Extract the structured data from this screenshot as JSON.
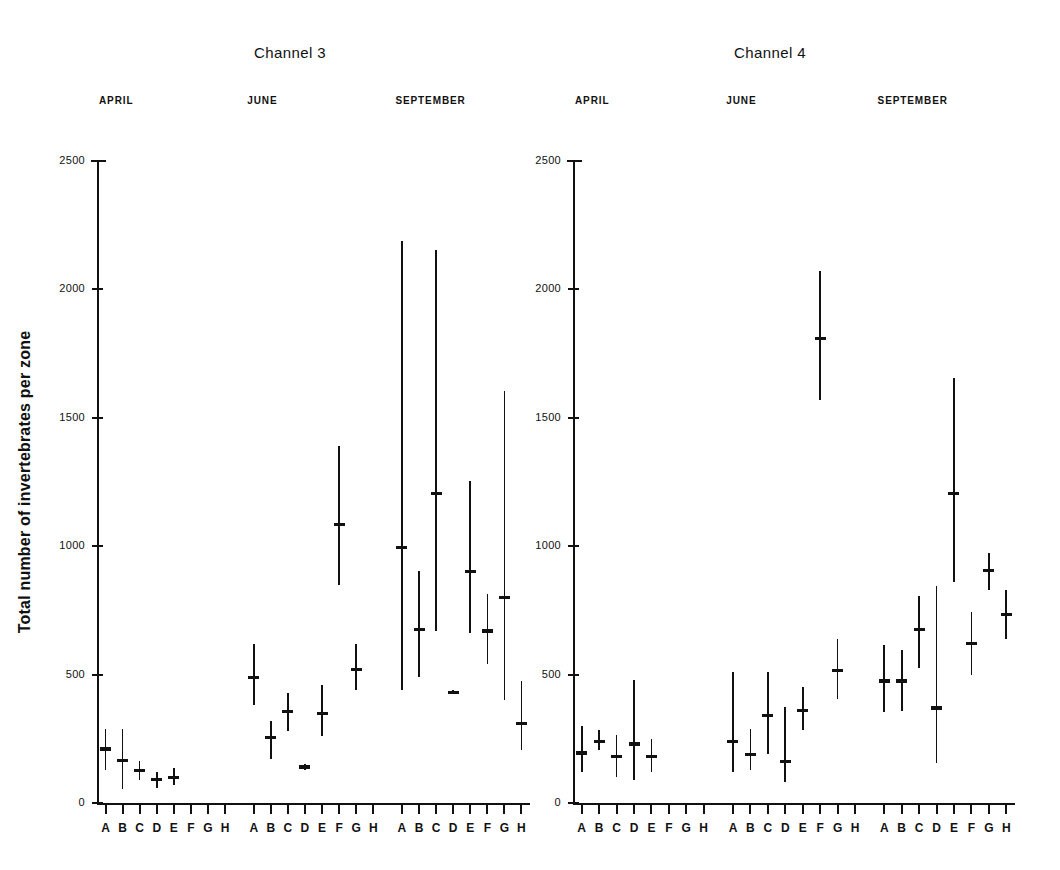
{
  "figure": {
    "ylabel": "Total number of invertebrates per zone",
    "yticks": [
      0,
      500,
      1000,
      1500,
      2000,
      2500
    ],
    "ymin": 0,
    "ymax": 2500,
    "months": [
      "APRIL",
      "JUNE",
      "SEPTEMBER"
    ],
    "zones": [
      "A",
      "B",
      "C",
      "D",
      "E",
      "F",
      "G",
      "H"
    ],
    "ink_color": "#111111",
    "background_color": "#ffffff"
  },
  "chart_data": {
    "type": "scatter",
    "xlabel": "",
    "ylabel": "Total number of invertebrates per zone",
    "ylim": [
      0,
      2500
    ],
    "yticks": [
      0,
      500,
      1000,
      1500,
      2000,
      2500
    ],
    "grid": false,
    "legend": "none",
    "marker": "mean with vertical range bar",
    "categories": [
      "A",
      "B",
      "C",
      "D",
      "E",
      "F",
      "G",
      "H"
    ],
    "panels": [
      {
        "name": "Channel 3",
        "groups": [
          {
            "month": "APRIL",
            "points": [
              {
                "zone": "A",
                "mean": 210,
                "low": 130,
                "high": 290
              },
              {
                "zone": "B",
                "mean": 165,
                "low": 55,
                "high": 290
              },
              {
                "zone": "C",
                "mean": 125,
                "low": 90,
                "high": 165
              },
              {
                "zone": "D",
                "mean": 90,
                "low": 60,
                "high": 120
              },
              {
                "zone": "E",
                "mean": 100,
                "low": 70,
                "high": 135
              },
              {
                "zone": "F",
                "mean": null,
                "low": null,
                "high": null
              },
              {
                "zone": "G",
                "mean": null,
                "low": null,
                "high": null
              },
              {
                "zone": "H",
                "mean": null,
                "low": null,
                "high": null
              }
            ]
          },
          {
            "month": "JUNE",
            "points": [
              {
                "zone": "A",
                "mean": 490,
                "low": 380,
                "high": 620
              },
              {
                "zone": "B",
                "mean": 255,
                "low": 170,
                "high": 320
              },
              {
                "zone": "C",
                "mean": 355,
                "low": 280,
                "high": 430
              },
              {
                "zone": "D",
                "mean": 140,
                "low": 130,
                "high": 150
              },
              {
                "zone": "E",
                "mean": 350,
                "low": 260,
                "high": 460
              },
              {
                "zone": "F",
                "mean": 1085,
                "low": 850,
                "high": 1390
              },
              {
                "zone": "G",
                "mean": 520,
                "low": 440,
                "high": 620
              },
              {
                "zone": "H",
                "mean": null,
                "low": null,
                "high": null
              }
            ]
          },
          {
            "month": "SEPTEMBER",
            "points": [
              {
                "zone": "A",
                "mean": 995,
                "low": 440,
                "high": 2190
              },
              {
                "zone": "B",
                "mean": 675,
                "low": 490,
                "high": 905
              },
              {
                "zone": "C",
                "mean": 1205,
                "low": 670,
                "high": 2155
              },
              {
                "zone": "D",
                "mean": 430,
                "low": 425,
                "high": 440
              },
              {
                "zone": "E",
                "mean": 900,
                "low": 660,
                "high": 1255
              },
              {
                "zone": "F",
                "mean": 670,
                "low": 540,
                "high": 815
              },
              {
                "zone": "G",
                "mean": 800,
                "low": 400,
                "high": 1605
              },
              {
                "zone": "H",
                "mean": 310,
                "low": 205,
                "high": 475
              }
            ]
          }
        ]
      },
      {
        "name": "Channel 4",
        "groups": [
          {
            "month": "APRIL",
            "points": [
              {
                "zone": "A",
                "mean": 195,
                "low": 120,
                "high": 300
              },
              {
                "zone": "B",
                "mean": 240,
                "low": 205,
                "high": 285
              },
              {
                "zone": "C",
                "mean": 180,
                "low": 100,
                "high": 265
              },
              {
                "zone": "D",
                "mean": 230,
                "low": 90,
                "high": 480
              },
              {
                "zone": "E",
                "mean": 180,
                "low": 120,
                "high": 250
              },
              {
                "zone": "F",
                "mean": null,
                "low": null,
                "high": null
              },
              {
                "zone": "G",
                "mean": null,
                "low": null,
                "high": null
              },
              {
                "zone": "H",
                "mean": null,
                "low": null,
                "high": null
              }
            ]
          },
          {
            "month": "JUNE",
            "points": [
              {
                "zone": "A",
                "mean": 240,
                "low": 120,
                "high": 510
              },
              {
                "zone": "B",
                "mean": 190,
                "low": 130,
                "high": 290
              },
              {
                "zone": "C",
                "mean": 340,
                "low": 190,
                "high": 510
              },
              {
                "zone": "D",
                "mean": 160,
                "low": 80,
                "high": 375
              },
              {
                "zone": "E",
                "mean": 360,
                "low": 285,
                "high": 450
              },
              {
                "zone": "F",
                "mean": 1810,
                "low": 1570,
                "high": 2070
              },
              {
                "zone": "G",
                "mean": 515,
                "low": 405,
                "high": 640
              },
              {
                "zone": "H",
                "mean": null,
                "low": null,
                "high": null
              }
            ]
          },
          {
            "month": "SEPTEMBER",
            "points": [
              {
                "zone": "A",
                "mean": 475,
                "low": 355,
                "high": 615
              },
              {
                "zone": "B",
                "mean": 475,
                "low": 360,
                "high": 595
              },
              {
                "zone": "C",
                "mean": 675,
                "low": 525,
                "high": 805
              },
              {
                "zone": "D",
                "mean": 370,
                "low": 155,
                "high": 845
              },
              {
                "zone": "E",
                "mean": 1205,
                "low": 860,
                "high": 1655
              },
              {
                "zone": "F",
                "mean": 620,
                "low": 500,
                "high": 745
              },
              {
                "zone": "G",
                "mean": 905,
                "low": 830,
                "high": 975
              },
              {
                "zone": "H",
                "mean": 735,
                "low": 640,
                "high": 830
              }
            ]
          }
        ]
      }
    ]
  }
}
